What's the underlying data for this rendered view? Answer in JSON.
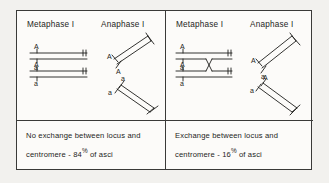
{
  "figure": {
    "panels": [
      {
        "id": "no-exchange",
        "stage_labels": {
          "metaphase": "Metaphase I",
          "anaphase": "Anaphase I"
        },
        "metaphase": {
          "allele_labels": [
            "A",
            "A",
            "a",
            "a"
          ],
          "crossover": false
        },
        "anaphase": {
          "upper_group_labels": [
            "A",
            "A"
          ],
          "lower_group_labels": [
            "a",
            "a"
          ]
        },
        "caption": {
          "line1": "No  exchange  between  locus  and",
          "line2_prefix": "centromere -",
          "percent": "84",
          "percent_symbol": "%",
          "line2_suffix": "of  asci"
        }
      },
      {
        "id": "exchange",
        "stage_labels": {
          "metaphase": "Metaphase I",
          "anaphase": "Anaphase I"
        },
        "metaphase": {
          "allele_labels": [
            "A",
            "A",
            "a",
            "a"
          ],
          "crossover": true
        },
        "anaphase": {
          "upper_group_labels": [
            "A",
            "a"
          ],
          "lower_group_labels": [
            "a",
            "A"
          ]
        },
        "caption": {
          "line1": "Exchange  between  locus  and",
          "line2_prefix": "centromere -",
          "percent": "16",
          "percent_symbol": "%",
          "line2_suffix": "of  asci"
        }
      }
    ],
    "colors": {
      "ink": "#1d1d1b",
      "frame": "#3a3a38",
      "page": "#fcfbf9",
      "surround": "#f2f1ee"
    }
  }
}
